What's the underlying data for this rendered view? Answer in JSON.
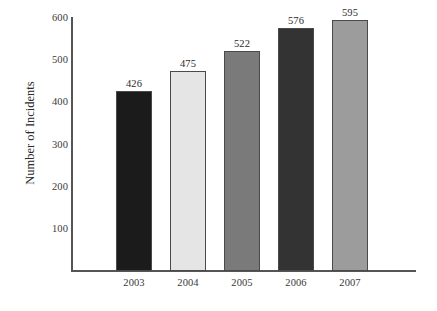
{
  "chart_data": {
    "type": "bar",
    "title": "",
    "subtitle": "",
    "xlabel": "",
    "ylabel": "Number of Incidents",
    "categories": [
      "2003",
      "2004",
      "2005",
      "2006",
      "2007"
    ],
    "values": [
      426,
      475,
      522,
      576,
      595
    ],
    "value_labels": [
      "426",
      "475",
      "522",
      "576",
      "595"
    ],
    "series": [
      {
        "name": "Number of Incidents",
        "values": [
          426,
          475,
          522,
          576,
          595
        ]
      }
    ],
    "ylim": [
      0,
      600
    ],
    "xlim_note": "categorical",
    "y_ticks": [
      600,
      500,
      400,
      300,
      200,
      100
    ],
    "y_tick_labels": [
      "600",
      "500",
      "400",
      "300",
      "200",
      "100"
    ],
    "grid": false,
    "legend": false,
    "legend_position": "none",
    "bar_colors": [
      "#1b1b1b",
      "#e5e5e5",
      "#7a7a7a",
      "#333333",
      "#9c9c9c"
    ],
    "bar_border_color": "#4a4a4a",
    "axis_color": "#555555",
    "background_color": "#ffffff",
    "text_color": "#2b2b2b",
    "annotations": []
  },
  "axis": {
    "y_title": "Number of Incidents"
  }
}
